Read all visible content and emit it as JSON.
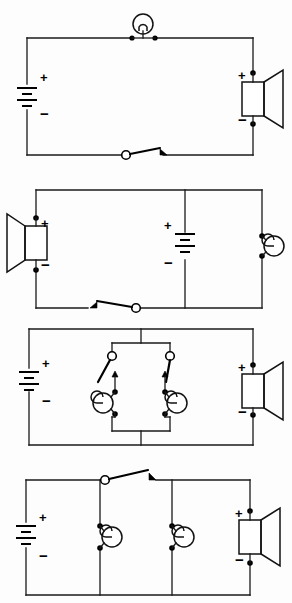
{
  "document": {
    "title": "Electrical Circuit Diagrams Worksheet",
    "page_type": "circuit-diagram-sheet",
    "background_color": "#fdfdfd",
    "ink_color": "#121212",
    "circuit_count": 4
  },
  "symbol_legend": {
    "battery": "battery-symbol",
    "lamp": "lamp-bulb-symbol",
    "speaker": "speaker-symbol",
    "buzzer": "buzzer-bell-symbol",
    "switch": "open-switch-symbol",
    "junction": "junction-dot",
    "plus_label": "+",
    "minus_label": "−"
  },
  "circuits": [
    {
      "id": "circuit-1",
      "name": "series-loop-lamp-speaker",
      "description": "Single series loop: battery, lamp at top, speaker at right, open switch at bottom.",
      "components": [
        {
          "type": "battery",
          "name": "battery-1",
          "position": "left",
          "plus": "+",
          "minus": "−",
          "cells": 2
        },
        {
          "type": "lamp",
          "name": "lamp-1",
          "position": "top-center"
        },
        {
          "type": "speaker",
          "name": "speaker-1",
          "position": "right",
          "plus": "+",
          "minus": "−",
          "facing": "right"
        },
        {
          "type": "switch",
          "name": "switch-1",
          "position": "bottom-center",
          "state": "open",
          "pivot": "left"
        }
      ]
    },
    {
      "id": "circuit-2",
      "name": "speaker-battery-buzzer-branch",
      "description": "Outer loop with speaker at left and buzzer at right; battery on a central vertical branch; open switch on bottom-left wire.",
      "components": [
        {
          "type": "speaker",
          "name": "speaker-2",
          "position": "left",
          "plus": "+",
          "minus": "−",
          "facing": "left"
        },
        {
          "type": "battery",
          "name": "battery-2",
          "position": "center-branch",
          "plus": "+",
          "minus": "−",
          "cells": 2
        },
        {
          "type": "buzzer",
          "name": "buzzer-2",
          "position": "right",
          "facing": "right"
        },
        {
          "type": "switch",
          "name": "switch-2",
          "position": "bottom-left",
          "state": "open",
          "pivot": "right"
        }
      ]
    },
    {
      "id": "circuit-3",
      "name": "parallel-switch-buzzer-pairs",
      "description": "Battery at left and speaker at right on outer loop; central box holds two parallel branches, each with an open switch in series with a buzzer.",
      "components": [
        {
          "type": "battery",
          "name": "battery-3",
          "position": "left",
          "plus": "+",
          "minus": "−",
          "cells": 2
        },
        {
          "type": "switch",
          "name": "switch-3-left",
          "position": "inner-left-branch",
          "state": "open",
          "pivot": "top"
        },
        {
          "type": "switch",
          "name": "switch-3-right",
          "position": "inner-right-branch",
          "state": "open",
          "pivot": "top"
        },
        {
          "type": "buzzer",
          "name": "buzzer-3-left",
          "position": "inner-left-branch",
          "facing": "left"
        },
        {
          "type": "buzzer",
          "name": "buzzer-3-right",
          "position": "inner-right-branch",
          "facing": "right"
        },
        {
          "type": "speaker",
          "name": "speaker-3",
          "position": "right",
          "plus": "+",
          "minus": "−",
          "facing": "right"
        }
      ]
    },
    {
      "id": "circuit-4",
      "name": "parallel-buzzers-with-speaker",
      "description": "Battery at left, two buzzers on parallel vertical branches, speaker at right; open switch sits on the top wire between the first and second branch.",
      "components": [
        {
          "type": "battery",
          "name": "battery-4",
          "position": "left",
          "plus": "+",
          "minus": "−",
          "cells": 2
        },
        {
          "type": "buzzer",
          "name": "buzzer-4-left",
          "position": "branch-1",
          "facing": "right"
        },
        {
          "type": "switch",
          "name": "switch-4",
          "position": "top-between-branches",
          "state": "open",
          "pivot": "left"
        },
        {
          "type": "buzzer",
          "name": "buzzer-4-right",
          "position": "branch-2",
          "facing": "right"
        },
        {
          "type": "speaker",
          "name": "speaker-4",
          "position": "right",
          "plus": "+",
          "minus": "−",
          "facing": "right"
        }
      ]
    }
  ]
}
